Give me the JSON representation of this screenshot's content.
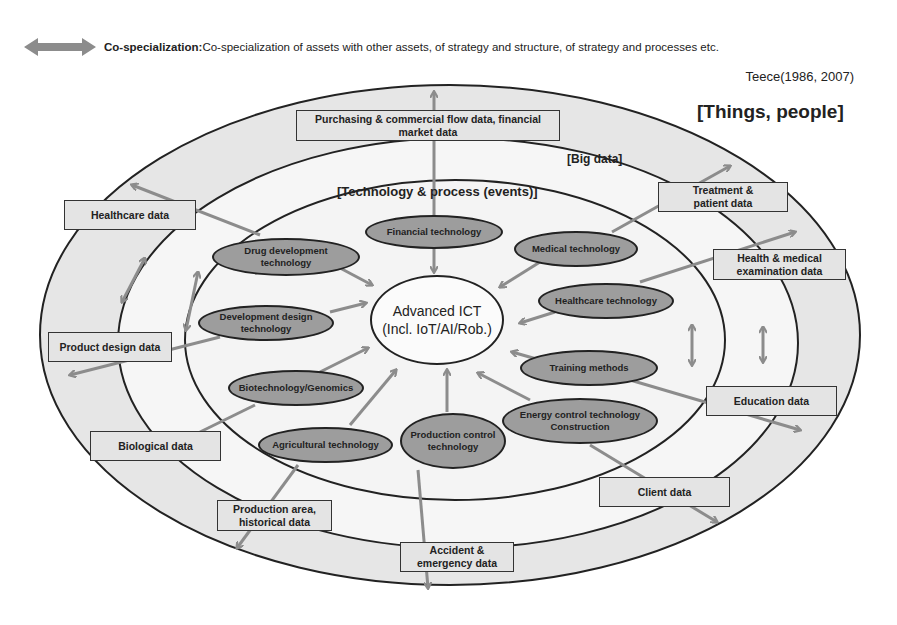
{
  "legend": {
    "icon": "double-arrow-icon",
    "term": "Co-specialization:",
    "description": " Co-specialization of assets with other assets, of strategy and structure, of strategy and processes etc."
  },
  "citation": "Teece(1986, 2007)",
  "rings": {
    "outer_label": "[Things, people]",
    "middle_label": "[Big data]",
    "inner_label": "[Technology & process (events)]"
  },
  "center": {
    "line1": "Advanced ICT",
    "line2": "(Incl. IoT/AI/Rob.)"
  },
  "technologies": [
    {
      "id": "financial",
      "label": "Financial technology"
    },
    {
      "id": "drug",
      "label": "Drug development technology"
    },
    {
      "id": "medical",
      "label": "Medical technology"
    },
    {
      "id": "dev-design",
      "label": "Development design technology"
    },
    {
      "id": "healthcare-tech",
      "label": "Healthcare technology"
    },
    {
      "id": "training",
      "label": "Training methods"
    },
    {
      "id": "biotech",
      "label": "Biotechnology/Genomics"
    },
    {
      "id": "energy",
      "label": "Energy control technology Construction"
    },
    {
      "id": "agri",
      "label": "Agricultural technology"
    },
    {
      "id": "production",
      "label": "Production control technology"
    }
  ],
  "data_boxes": [
    {
      "id": "purchasing",
      "label": "Purchasing & commercial flow data, financial market data"
    },
    {
      "id": "healthcare-data",
      "label": "Healthcare data"
    },
    {
      "id": "treatment",
      "label": "Treatment & patient data"
    },
    {
      "id": "health-exam",
      "label": "Health & medical examination data"
    },
    {
      "id": "product-design",
      "label": "Product design data"
    },
    {
      "id": "education",
      "label": "Education data"
    },
    {
      "id": "biological",
      "label": "Biological data"
    },
    {
      "id": "client",
      "label": "Client data"
    },
    {
      "id": "production-area",
      "label": "Production area, historical data"
    },
    {
      "id": "accident",
      "label": "Accident & emergency data"
    }
  ],
  "colors": {
    "outer_ring": "#e6e6e6",
    "inner_fill": "#f4f4f4",
    "oval_fill": "#9d9d9d",
    "arrow": "#8c8c8c",
    "stroke": "#222222"
  }
}
